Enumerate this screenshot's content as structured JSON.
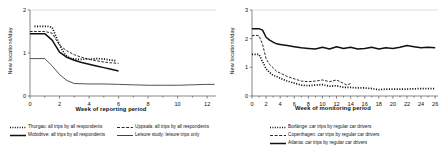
{
  "figure": {
    "panels": [
      {
        "id": "left",
        "axes": {
          "ylabel": "New locations/day",
          "xlabel": "Week of reporting period",
          "yticks": [
            "0",
            "1",
            "2"
          ],
          "xticks": [
            "0",
            "2",
            "4",
            "6",
            "8",
            "10",
            "12"
          ]
        },
        "legend": [
          {
            "label": "Thurgau: all trips by all respondents",
            "style": "dotted",
            "color": "#1a1a1a"
          },
          {
            "label": "Uppsala: all trips by all respondents",
            "style": "dashed",
            "color": "#1a1a1a"
          },
          {
            "label": "Mobidrive: all trips by all respondents",
            "style": "solid-thick",
            "color": "#000000"
          },
          {
            "label": "Leisure study: leisure trips only",
            "style": "solid-thin",
            "color": "#333333"
          }
        ]
      },
      {
        "id": "right",
        "axes": {
          "ylabel": "New locations/day",
          "xlabel": "Week of monitoring period",
          "yticks": [
            "0",
            "1",
            "2",
            "3"
          ],
          "xticks": [
            "0",
            "2",
            "4",
            "6",
            "8",
            "10",
            "12",
            "14",
            "16",
            "18",
            "20",
            "22",
            "24",
            "26"
          ]
        },
        "legend": [
          {
            "label": "Borlänge: car trips by regular car drivers",
            "style": "dotted",
            "color": "#1a1a1a"
          },
          {
            "label": "Copenhagen: car trips by regular car drivers",
            "style": "dashed",
            "color": "#1a1a1a"
          },
          {
            "label": "Atlanta: car trips by regular car drivers",
            "style": "solid-thick",
            "color": "#000000"
          }
        ]
      }
    ]
  },
  "chart_data": [
    {
      "type": "line",
      "panel": "left",
      "title": "",
      "xlabel": "Week of reporting period",
      "ylabel": "New locations/day",
      "xlim": [
        0,
        12.6
      ],
      "ylim": [
        0,
        2
      ],
      "xticks": [
        0,
        2,
        4,
        6,
        8,
        10,
        12
      ],
      "yticks": [
        0,
        1,
        2
      ],
      "grid": false,
      "legend_position": "below",
      "series": [
        {
          "name": "Thurgau: all trips by all respondents",
          "style": "dotted",
          "x": [
            0.3,
            0.6,
            0.9,
            1.2,
            1.5,
            1.8,
            2.1,
            2.4,
            2.7,
            3.0,
            3.4,
            3.8,
            4.2,
            4.6,
            5.0,
            5.4,
            5.8
          ],
          "y": [
            1.62,
            1.62,
            1.62,
            1.62,
            1.6,
            1.35,
            1.12,
            0.95,
            0.88,
            0.86,
            0.85,
            0.86,
            0.86,
            0.87,
            0.86,
            0.84,
            0.82
          ]
        },
        {
          "name": "Uppsala: all trips by all respondents",
          "style": "dashed",
          "x": [
            0.0,
            0.5,
            1.0,
            1.5,
            2.0,
            2.5,
            3.0,
            3.5,
            4.0,
            4.5,
            5.0,
            5.5,
            6.0
          ],
          "y": [
            1.5,
            1.5,
            1.5,
            1.46,
            1.18,
            1.05,
            0.96,
            0.9,
            0.85,
            0.82,
            0.79,
            0.77,
            0.76
          ]
        },
        {
          "name": "Mobidrive: all trips by all respondents",
          "style": "solid-thick",
          "x": [
            0.0,
            0.5,
            1.0,
            1.5,
            2.0,
            2.5,
            3.0,
            3.5,
            4.0,
            4.5,
            5.0,
            5.5,
            6.0
          ],
          "y": [
            1.45,
            1.45,
            1.45,
            1.3,
            1.02,
            0.9,
            0.83,
            0.78,
            0.74,
            0.7,
            0.66,
            0.62,
            0.58
          ]
        },
        {
          "name": "Leisure study: leisure trips only",
          "style": "solid-thin",
          "x": [
            0.0,
            0.5,
            1.0,
            1.5,
            2.0,
            2.5,
            3.0,
            4.0,
            5.0,
            6.0,
            7.0,
            8.0,
            9.0,
            10.0,
            11.0,
            12.0,
            12.5
          ],
          "y": [
            0.87,
            0.87,
            0.87,
            0.7,
            0.5,
            0.36,
            0.29,
            0.28,
            0.28,
            0.27,
            0.26,
            0.25,
            0.25,
            0.25,
            0.26,
            0.27,
            0.27
          ]
        }
      ]
    },
    {
      "type": "line",
      "panel": "right",
      "title": "",
      "xlabel": "Week of monitoring period",
      "ylabel": "New locations/day",
      "xlim": [
        0,
        26.4
      ],
      "ylim": [
        0,
        3
      ],
      "xticks": [
        0,
        2,
        4,
        6,
        8,
        10,
        12,
        14,
        16,
        18,
        20,
        22,
        24,
        26
      ],
      "yticks": [
        0,
        1,
        2,
        3
      ],
      "grid": false,
      "legend_position": "below",
      "series": [
        {
          "name": "Atlanta: car trips by regular car drivers",
          "style": "solid-thick",
          "x": [
            0,
            0.5,
            1,
            1.5,
            2,
            2.5,
            3,
            3.5,
            4,
            5,
            6,
            7,
            8,
            9,
            10,
            11,
            12,
            13,
            14,
            15,
            16,
            17,
            18,
            19,
            20,
            21,
            22,
            23,
            24,
            25,
            26
          ],
          "y": [
            2.35,
            2.35,
            2.35,
            2.3,
            2.05,
            1.95,
            1.88,
            1.82,
            1.8,
            1.76,
            1.72,
            1.68,
            1.66,
            1.64,
            1.7,
            1.64,
            1.72,
            1.66,
            1.7,
            1.64,
            1.66,
            1.7,
            1.64,
            1.68,
            1.66,
            1.7,
            1.76,
            1.72,
            1.68,
            1.7,
            1.68
          ]
        },
        {
          "name": "Copenhagen: car trips by regular car drivers",
          "style": "dashed",
          "x": [
            0,
            0.5,
            1,
            1.5,
            2,
            2.5,
            3,
            3.5,
            4,
            5,
            6,
            7,
            8,
            9,
            10,
            11,
            12,
            13,
            13.5,
            14
          ],
          "y": [
            2.1,
            2.12,
            2.1,
            1.8,
            1.3,
            1.1,
            0.98,
            0.86,
            0.8,
            0.68,
            0.6,
            0.52,
            0.5,
            0.52,
            0.56,
            0.5,
            0.56,
            0.44,
            0.38,
            0.44
          ]
        },
        {
          "name": "Borlänge: car trips by regular car drivers",
          "style": "dotted",
          "x": [
            0,
            0.5,
            1,
            1.5,
            2,
            2.5,
            3,
            3.5,
            4,
            5,
            6,
            7,
            8,
            9,
            10,
            11,
            12,
            13,
            14,
            15,
            16,
            17,
            18,
            19,
            20,
            21,
            22,
            23,
            24,
            25,
            26
          ],
          "y": [
            1.45,
            1.45,
            1.45,
            1.2,
            0.95,
            0.82,
            0.72,
            0.68,
            0.62,
            0.52,
            0.45,
            0.38,
            0.36,
            0.38,
            0.4,
            0.34,
            0.36,
            0.3,
            0.3,
            0.28,
            0.28,
            0.26,
            0.22,
            0.24,
            0.24,
            0.24,
            0.24,
            0.25,
            0.26,
            0.26,
            0.26
          ]
        }
      ]
    }
  ]
}
